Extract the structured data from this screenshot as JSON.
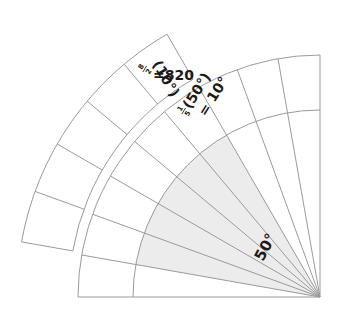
{
  "diagram": {
    "center": {
      "x": 320,
      "y": 297
    },
    "colors": {
      "line": "#9a9a9a",
      "shade": "#ececec",
      "text": "#1a1a1a",
      "background": "#ffffff"
    },
    "inner_sector": {
      "radius": 187,
      "start_deg": 90,
      "end_deg": 180
    },
    "middle_ring": {
      "inner_radius": 187,
      "outer_radius": 242,
      "start_deg": 90,
      "end_deg": 180
    },
    "outer_band": {
      "inner_radius": 248,
      "outer_radius": 300,
      "start_deg": 120,
      "end_deg": 170
    },
    "spokes_step_deg": 10,
    "shaded_sector": {
      "start_deg": 120,
      "end_deg": 170,
      "span_label": "50°"
    },
    "labels": {
      "angle_label": "50°",
      "middle_label": {
        "numerator": "1",
        "denominator": "5",
        "line1": "(50°)",
        "line2": "= 10°"
      },
      "outer_label": {
        "numerator": "8",
        "denominator": "2",
        "line1": "(10°)",
        "line2": "=820"
      }
    }
  }
}
